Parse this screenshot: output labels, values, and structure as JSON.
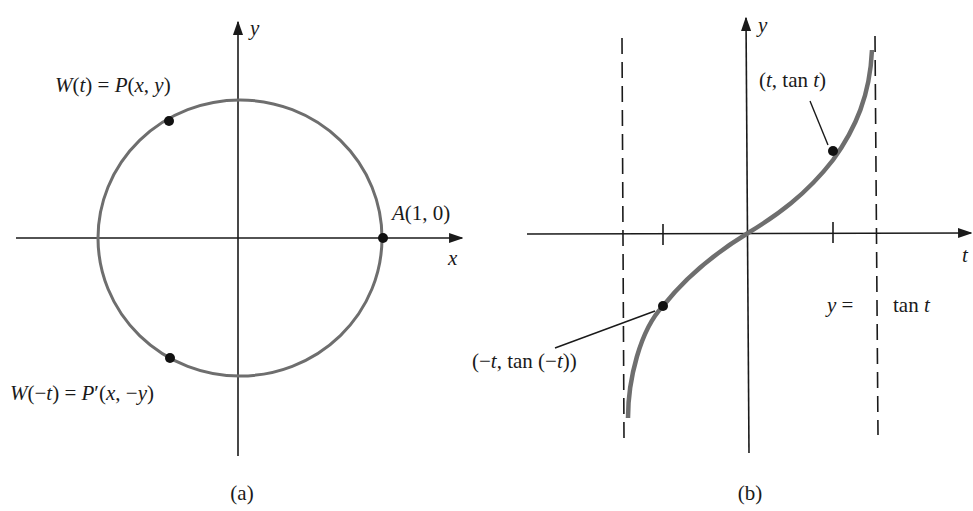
{
  "figure": {
    "panel_a": {
      "caption": "(a)",
      "axis_x_label": "x",
      "axis_y_label": "y",
      "point_A_label": "A(1, 0)",
      "point_W_t_label": "W(t) = P(x, y)",
      "point_W_neg_t_label": "W(−t) = P′(x, −y)"
    },
    "panel_b": {
      "caption": "(b)",
      "axis_x_label": "t",
      "axis_y_label": "y",
      "point_t_label": "(t, tan t)",
      "point_neg_t_label": "(−t, tan (−t))",
      "curve_label_left": "y =",
      "curve_label_right": "tan t"
    },
    "colors": {
      "axis": "#1a1a1a",
      "curve": "#6e6e6e",
      "point": "#111111",
      "background": "#ffffff"
    }
  },
  "chart_data": [
    {
      "type": "diagram",
      "title": "Unit circle with symmetric points",
      "panel": "(a)",
      "shape": "unit circle centered at origin",
      "points": [
        {
          "label": "A(1, 0)",
          "x": 1,
          "y": 0
        },
        {
          "label": "W(t) = P(x, y)",
          "x": -0.5,
          "y": 0.85
        },
        {
          "label": "W(−t) = P′(x, −y)",
          "x": -0.5,
          "y": -0.85
        }
      ],
      "xlabel": "x",
      "ylabel": "y"
    },
    {
      "type": "line",
      "title": "y = tan t",
      "panel": "(b)",
      "function": "tan t",
      "domain": [
        -1.4,
        1.47
      ],
      "asymptotes": [
        -1.5708,
        1.5708
      ],
      "ticks": [
        -1.035,
        1.035
      ],
      "points": [
        {
          "label": "(t, tan t)",
          "t": 1.035,
          "y": 1.68
        },
        {
          "label": "(−t, tan (−t))",
          "t": -1.035,
          "y": -1.68
        }
      ],
      "xlabel": "t",
      "ylabel": "y"
    }
  ]
}
